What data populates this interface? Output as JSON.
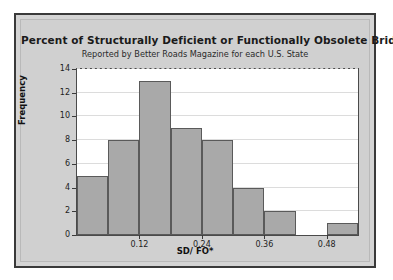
{
  "chart_data": {
    "type": "bar",
    "title": "Percent of Structurally Deficient or Functionally Obsolete Bridges",
    "subtitle": "Reported by Better Roads Magazine for each U.S. State",
    "xlabel": "SD/ FO*",
    "ylabel": "Frequency",
    "bin_width": 0.06,
    "bin_starts": [
      0.0,
      0.06,
      0.12,
      0.18,
      0.24,
      0.3,
      0.36,
      0.42,
      0.48
    ],
    "values": [
      5,
      8,
      13,
      9,
      8,
      4,
      2,
      0,
      1
    ],
    "xlim": [
      0.0,
      0.54
    ],
    "ylim": [
      0,
      14
    ],
    "ytick_labels": [
      "0",
      "2",
      "4",
      "6",
      "8",
      "10",
      "12",
      "14"
    ],
    "ytick_values": [
      0,
      2,
      4,
      6,
      8,
      10,
      12,
      14
    ],
    "xtick_labels": [
      "0.12",
      "0.24",
      "0.36",
      "0.48"
    ],
    "xtick_values": [
      0.12,
      0.24,
      0.36,
      0.48
    ],
    "grid": true,
    "legend": "none",
    "bar_color": "#a9a9a9",
    "bar_edge_color": "#5a5a5a",
    "plot_background": "#ffffff",
    "panel_background": "#d0d0d0"
  }
}
